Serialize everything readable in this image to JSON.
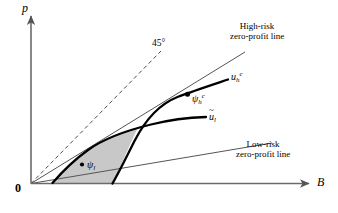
{
  "figure": {
    "type": "economics-diagram",
    "title_visible": false,
    "background_color": "#ffffff",
    "axes": {
      "y_axis_label": "p",
      "x_axis_label": "B",
      "origin_label": "0",
      "axis_color": "#6b6b6b",
      "arrowheads": true
    },
    "annotations": {
      "forty_five_degree": "45°",
      "high_risk_line_label_line1": "High-risk",
      "high_risk_line_label_line2": "zero-profit line",
      "low_risk_line_label_line1": "Low-risk",
      "low_risk_line_label_line2": "zero-profit line"
    },
    "curve_labels": {
      "high_risk_indifference": {
        "base": "u",
        "sub": "h",
        "sup": "c",
        "tilde": false
      },
      "low_risk_indifference": {
        "base": "u",
        "sub": "l",
        "sup": "",
        "tilde": true
      }
    },
    "points": [
      {
        "id": "psi-h-c",
        "base": "ψ",
        "sub": "h",
        "sup": "c",
        "x": 188,
        "y": 96,
        "marked": true
      },
      {
        "id": "psi-l",
        "base": "ψ",
        "sub": "l",
        "sup": "",
        "x": 86,
        "y": 163,
        "marked": true
      }
    ],
    "shaded_region": {
      "fill_color": "#c8c8c8",
      "description": "lens-shaped region bounded above by the low-risk indifference curve, on the right by the high-risk indifference curve, and below by the low-risk zero-profit line"
    },
    "line_styles": {
      "zero_profit_line_color": "#555555",
      "forty_five_degree_style": "dashed",
      "indifference_curve_color": "#000000",
      "indifference_curve_width": "2.3"
    }
  }
}
